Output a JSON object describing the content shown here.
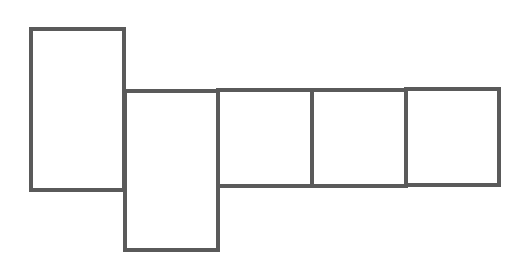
{
  "diagram": {
    "type": "net-of-cuboid",
    "stroke_color": "#5a5a5a",
    "stroke_width": 4,
    "background": "#ffffff",
    "faces": [
      {
        "id": "face-1",
        "x": 31,
        "y": 29,
        "width": 93,
        "height": 161
      },
      {
        "id": "face-2",
        "x": 125,
        "y": 91,
        "width": 93,
        "height": 159
      },
      {
        "id": "face-3",
        "x": 218,
        "y": 90,
        "width": 94,
        "height": 96
      },
      {
        "id": "face-4",
        "x": 312,
        "y": 90,
        "width": 94,
        "height": 96
      },
      {
        "id": "face-5",
        "x": 406,
        "y": 89,
        "width": 93,
        "height": 96
      }
    ]
  }
}
